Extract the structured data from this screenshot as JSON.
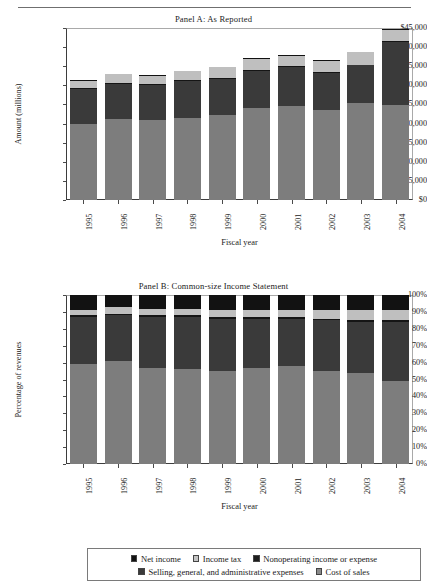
{
  "running_head": "",
  "panel_a": {
    "title": "Panel A: As Reported",
    "ylabel": "Amount (millions)",
    "xlabel": "Fiscal year",
    "yticks": [
      "$0",
      "$5,000",
      "$10,000",
      "$15,000",
      "$20,000",
      "$25,000",
      "$30,000",
      "$35,000",
      "$40,000",
      "$45,000"
    ]
  },
  "panel_b": {
    "title": "Panel B: Common-size Income Statement",
    "ylabel": "Percentage of revenues",
    "xlabel": "Fiscal year",
    "yticks": [
      "0%",
      "10%",
      "20%",
      "30%",
      "40%",
      "50%",
      "60%",
      "70%",
      "80%",
      "90%",
      "100%"
    ]
  },
  "legend": {
    "row1": [
      {
        "label": "Net income",
        "swatch": "sw-net"
      },
      {
        "label": "Income tax",
        "swatch": "sw-tax"
      },
      {
        "label": "Nonoperating income or expense",
        "swatch": "sw-nonop"
      }
    ],
    "row2": [
      {
        "label": "Selling, general, and administrative expenses",
        "swatch": "sw-sga"
      },
      {
        "label": "Cost of sales",
        "swatch": "sw-cost"
      }
    ]
  },
  "colors": {
    "cost_of_sales": "#7d7d7d",
    "sga": "#3a3a3a",
    "nonoperating": "#151515",
    "income_tax": "#bfbfbf",
    "net_income": "#121212",
    "axis": "#3d3d3d",
    "text": "#1a1a1a"
  },
  "chart_data": [
    {
      "type": "bar",
      "stacked": true,
      "panel": "A",
      "title": "Panel A: As Reported",
      "xlabel": "Fiscal year",
      "ylabel": "Amount (millions)",
      "ylim": [
        0,
        45000
      ],
      "ytick_step": 5000,
      "grid": false,
      "legend_position": "bottom",
      "units": "US$ millions",
      "categories": [
        "1995",
        "1996",
        "1997",
        "1998",
        "1999",
        "2000",
        "2001",
        "2002",
        "2003",
        "2004"
      ],
      "series": [
        {
          "name": "Cost of sales",
          "values": [
            20000,
            21200,
            21000,
            21400,
            22200,
            24000,
            24700,
            23600,
            25300,
            24800
          ]
        },
        {
          "name": "Selling, general, and administrative expenses",
          "values": [
            9100,
            9100,
            9200,
            9700,
            9500,
            9700,
            10000,
            9700,
            9900,
            16500
          ]
        },
        {
          "name": "Nonoperating income or expense",
          "values": [
            250,
            250,
            250,
            250,
            250,
            250,
            250,
            250,
            250,
            300
          ]
        },
        {
          "name": "Income tax",
          "values": [
            1900,
            2300,
            2000,
            2300,
            2800,
            3000,
            2800,
            2900,
            3200,
            3000
          ]
        },
        {
          "name": "Net income",
          "values": [
            150,
            150,
            150,
            150,
            150,
            150,
            150,
            150,
            150,
            150
          ]
        }
      ],
      "totals": [
        31400,
        33000,
        32600,
        33800,
        34900,
        37100,
        37900,
        36600,
        38800,
        44750
      ]
    },
    {
      "type": "bar",
      "stacked": true,
      "panel": "B",
      "title": "Panel B: Common-size Income Statement",
      "xlabel": "Fiscal year",
      "ylabel": "Percentage of revenues",
      "ylim": [
        0,
        100
      ],
      "ytick_step": 10,
      "grid": false,
      "legend_position": "bottom",
      "units": "percent of revenues",
      "categories": [
        "1995",
        "1996",
        "1997",
        "1998",
        "1999",
        "2000",
        "2001",
        "2002",
        "2003",
        "2004"
      ],
      "series": [
        {
          "name": "Cost of sales",
          "values": [
            59,
            61,
            57,
            56,
            55,
            57,
            58,
            55,
            54,
            49
          ]
        },
        {
          "name": "Selling, general, and administrative expenses",
          "values": [
            28,
            27,
            30,
            31,
            31,
            29,
            28,
            30,
            30,
            35
          ]
        },
        {
          "name": "Nonoperating income or expense",
          "values": [
            1,
            1,
            1,
            1,
            1,
            1,
            1,
            1,
            1,
            1
          ]
        },
        {
          "name": "Income tax",
          "values": [
            3,
            4,
            4,
            4,
            4,
            4,
            4,
            5,
            6,
            6
          ]
        },
        {
          "name": "Net income",
          "values": [
            9,
            7,
            8,
            8,
            9,
            9,
            9,
            9,
            9,
            9
          ]
        }
      ],
      "totals": [
        100,
        100,
        100,
        100,
        100,
        100,
        100,
        100,
        100,
        100
      ]
    }
  ]
}
